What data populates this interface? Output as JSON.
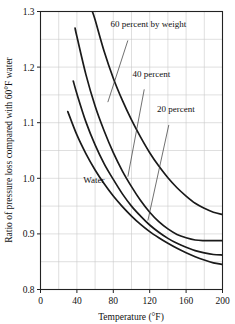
{
  "chart_data": {
    "type": "line",
    "title": "",
    "xlabel": "Temperature (°F)",
    "ylabel": "Ratio of pressure loss compared with 60°F water",
    "xlim": [
      0,
      200
    ],
    "ylim": [
      0.8,
      1.3
    ],
    "xticks": [
      0,
      40,
      80,
      120,
      160,
      200
    ],
    "xtick_labels": [
      "0",
      "40",
      "80",
      "120",
      "160",
      "200"
    ],
    "yticks": [
      0.8,
      0.9,
      1.0,
      1.1,
      1.2,
      1.3
    ],
    "ytick_labels": [
      "0.8",
      "0.9",
      "1.0",
      "1.1",
      "1.2",
      "1.3"
    ],
    "grid": true,
    "grid_x_step": 20,
    "grid_y_step": 0.05,
    "legend_position": "inline-annotations",
    "series": [
      {
        "name": "60 percent by weight",
        "label": "60 percent by weight",
        "x": [
          57,
          60,
          70,
          80,
          90,
          100,
          110,
          120,
          130,
          140,
          150,
          160,
          170,
          180,
          190,
          200
        ],
        "y": [
          1.3,
          1.285,
          1.228,
          1.18,
          1.14,
          1.105,
          1.074,
          1.046,
          1.022,
          1.001,
          0.983,
          0.968,
          0.955,
          0.946,
          0.939,
          0.935
        ]
      },
      {
        "name": "40 percent",
        "label": "40 percent",
        "x": [
          38,
          40,
          50,
          60,
          70,
          80,
          90,
          100,
          110,
          120,
          130,
          140,
          150,
          160,
          170,
          180,
          190,
          200
        ],
        "y": [
          1.27,
          1.255,
          1.186,
          1.13,
          1.085,
          1.046,
          1.013,
          0.985,
          0.96,
          0.939,
          0.922,
          0.909,
          0.899,
          0.893,
          0.889,
          0.888,
          0.888,
          0.888
        ]
      },
      {
        "name": "20 percent",
        "label": "20 percent",
        "x": [
          36,
          40,
          50,
          60,
          70,
          80,
          90,
          100,
          110,
          120,
          130,
          140,
          150,
          160,
          170,
          180,
          190,
          200
        ],
        "y": [
          1.175,
          1.152,
          1.101,
          1.06,
          1.026,
          0.998,
          0.972,
          0.95,
          0.932,
          0.916,
          0.903,
          0.892,
          0.883,
          0.876,
          0.87,
          0.866,
          0.863,
          0.862
        ]
      },
      {
        "name": "Water",
        "label": "Water",
        "x": [
          30,
          40,
          50,
          60,
          70,
          80,
          90,
          100,
          110,
          120,
          130,
          140,
          150,
          160,
          170,
          180,
          190,
          200
        ],
        "y": [
          1.12,
          1.078,
          1.044,
          1.015,
          0.99,
          0.968,
          0.949,
          0.932,
          0.917,
          0.904,
          0.893,
          0.883,
          0.874,
          0.866,
          0.859,
          0.853,
          0.848,
          0.845
        ]
      }
    ],
    "annotations": [
      {
        "text": "60 percent by weight",
        "text_x": 77,
        "text_y": 1.273,
        "leader_from_x": 96,
        "leader_from_y": 1.248,
        "leader_to_x": 74,
        "leader_to_y": 1.137
      },
      {
        "text": "40 percent",
        "text_x": 101,
        "text_y": 1.183,
        "leader_from_x": 114,
        "leader_from_y": 1.16,
        "leader_to_x": 96,
        "leader_to_y": 1.003
      },
      {
        "text": "20 percent",
        "text_x": 128,
        "text_y": 1.119,
        "leader_from_x": 141,
        "leader_from_y": 1.096,
        "leader_to_x": 118,
        "leader_to_y": 0.924
      },
      {
        "text": "Water",
        "text_x": 47,
        "text_y": 0.992,
        "leader_from_x": 0,
        "leader_from_y": 0,
        "leader_to_x": 0,
        "leader_to_y": 0
      }
    ],
    "colors": {
      "curve": "#1a1a1a",
      "grid": "#c9c9c9",
      "frame": "#222222",
      "text": "#111111",
      "background": "#ffffff"
    }
  }
}
